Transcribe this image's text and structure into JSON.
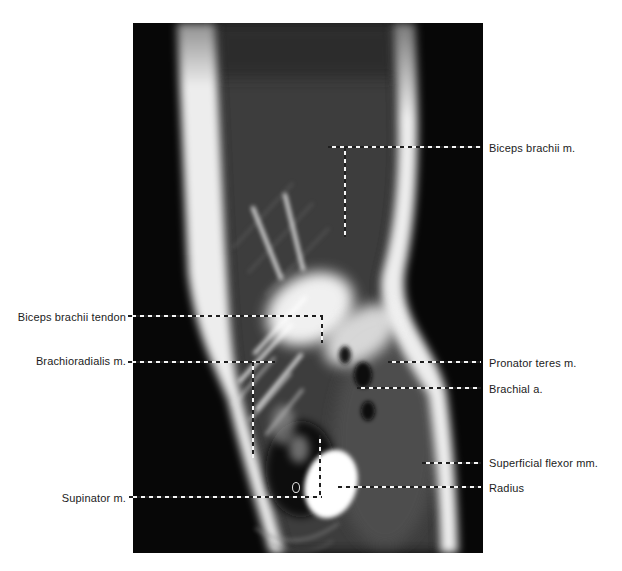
{
  "figure": {
    "image_area": {
      "x": 133,
      "y": 23,
      "width": 350,
      "height": 530
    },
    "colors": {
      "page_bg": "#ffffff",
      "image_bg": "#070707",
      "skin_band": "#ededed",
      "muscle": "#3c3c3c",
      "label_text": "#1c1c1c",
      "dash_light": "#f5f5f5",
      "dash_dark": "#1f1f1f"
    },
    "labels": [
      {
        "text": "Biceps brachii tendon",
        "side": "left",
        "x": 126,
        "y": 317
      },
      {
        "text": "Brachioradialis m.",
        "side": "left",
        "x": 126,
        "y": 361
      },
      {
        "text": "Supinator m.",
        "side": "left",
        "x": 126,
        "y": 498
      },
      {
        "text": "Biceps brachii m.",
        "side": "right",
        "x": 489,
        "y": 148
      },
      {
        "text": "Pronator teres m.",
        "side": "right",
        "x": 489,
        "y": 363
      },
      {
        "text": "Brachial a.",
        "side": "right",
        "x": 489,
        "y": 389
      },
      {
        "text": "Superficial flexor mm.",
        "side": "right",
        "x": 489,
        "y": 463
      },
      {
        "text": "Radius",
        "side": "right",
        "x": 489,
        "y": 488
      }
    ],
    "leader_lines": [
      {
        "label": "Biceps brachii tendon",
        "segments": [
          {
            "x1": 128,
            "y1": 316,
            "x2": 323,
            "y2": 316
          },
          {
            "x1": 322,
            "y1": 316,
            "x2": 322,
            "y2": 343
          }
        ]
      },
      {
        "label": "Brachioradialis m.",
        "segments": [
          {
            "x1": 128,
            "y1": 362,
            "x2": 275,
            "y2": 362
          },
          {
            "x1": 253,
            "y1": 362,
            "x2": 253,
            "y2": 458
          }
        ]
      },
      {
        "label": "Supinator m.",
        "segments": [
          {
            "x1": 129,
            "y1": 497,
            "x2": 322,
            "y2": 497
          },
          {
            "x1": 320,
            "y1": 435,
            "x2": 320,
            "y2": 497
          }
        ]
      },
      {
        "label": "Biceps brachii m.",
        "segments": [
          {
            "x1": 328,
            "y1": 147,
            "x2": 481,
            "y2": 147
          },
          {
            "x1": 345,
            "y1": 147,
            "x2": 345,
            "y2": 237
          }
        ]
      },
      {
        "label": "Pronator teres m.",
        "segments": [
          {
            "x1": 388,
            "y1": 362,
            "x2": 481,
            "y2": 362
          }
        ]
      },
      {
        "label": "Brachial a.",
        "segments": [
          {
            "x1": 357,
            "y1": 388,
            "x2": 481,
            "y2": 388
          }
        ]
      },
      {
        "label": "Superficial flexor mm.",
        "segments": [
          {
            "x1": 422,
            "y1": 463,
            "x2": 481,
            "y2": 463
          }
        ]
      },
      {
        "label": "Radius",
        "segments": [
          {
            "x1": 338,
            "y1": 487,
            "x2": 481,
            "y2": 487
          }
        ]
      }
    ],
    "marker": {
      "x": 292,
      "y": 482,
      "width": 6,
      "height": 9
    }
  }
}
